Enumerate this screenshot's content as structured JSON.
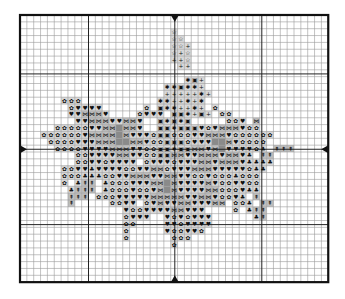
{
  "chart": {
    "origin_x": 20,
    "origin_y": 15,
    "cell": 6.85,
    "cols": 45,
    "rows": 39,
    "major_cols": [
      10,
      22.6,
      35.3
    ],
    "major_rows": [
      8.6,
      19.6,
      30.6
    ],
    "colors": {
      "grid_minor": "#9a9a9a",
      "grid_major": "#222222",
      "border": "#111111",
      "fill_light": "#d8d8d8",
      "fill_mid": "#bdbdbd",
      "fill_dark": "#8a8a8a",
      "symbol": "#111111"
    },
    "center_markers": [
      "top",
      "bottom",
      "left",
      "right"
    ],
    "legend_symbols": {
      "o": "flower",
      "h": "heart",
      "x": "bowtie",
      "c": "club",
      "t": "tree",
      "s": "star-outline",
      "+": "plus",
      "*": "asterisk",
      "d": "dot-square",
      "g": "grey-block"
    },
    "rows_map": [
      ".............................................",
      ".............................................",
      "......................s......................",
      "......................ss.....................",
      "......................ss+....................",
      "......................s+s....................",
      "......................++s....................",
      ".......................++....................",
      ".............................................",
      "........................*d+..................",
      ".....................**d**+..................",
      ".....................+++++*+.................",
      "......ooo...........**++*+*..................",
      ".......ohhhh......o.d**++*+.o................",
      ".......hhxxxh....ohhh.dd*+d+.oo..............",
      "........hhxxxhhxxh..d*d*d.....ooh.x..........",
      ".....ooooohhxxgxxh..dd*dddhohxxxhoo.........",
      "...oooooohxxxxgxhhhoddooohhxxxhoooooo........",
      "....oooohhhxxxggxxhoodddohhhggxhoooo.........",
      ".....oooohhhhxxxhhoodd*ddxxhxghhhhoc.ttt.....",
      "........oohhhhxxhhooddxxhhxxxhxxhc.tt........",
      "........oohhohhhh.ohhhohhhxxhxxxhcccc........",
      "......oohhchhhhoohhxxohhhxxxhhhhhocc.........",
      "......ooocccoohhxxxhhxxhhoohooocooo..........",
      "......o.ctt.cooohhhxxgxhhhhxhoohhoo..........",
      ".......cttt.cooohoohxgxhhhhxxooohcc..........",
      ".......ttt.ooohhhhhxxxxxhhxxhoohc.t..........",
      ".......t.....oohh.ohxhhxxhhhxx.ooc.tt........",
      "...............hoohhhhxxhhh....o.ctt.........",
      "...............ohhh..hohohhh......ct.........",
      "...............oo....hhohhhh.................",
      "...............o.....hoohho..................",
      "...............o......ooo....................",
      "......................o......................",
      ".............................................",
      ".............................................",
      ".............................................",
      ".............................................",
      "............................................."
    ],
    "fill_map_note": "non-empty cells shaded grey; stem/bud region lighter"
  }
}
